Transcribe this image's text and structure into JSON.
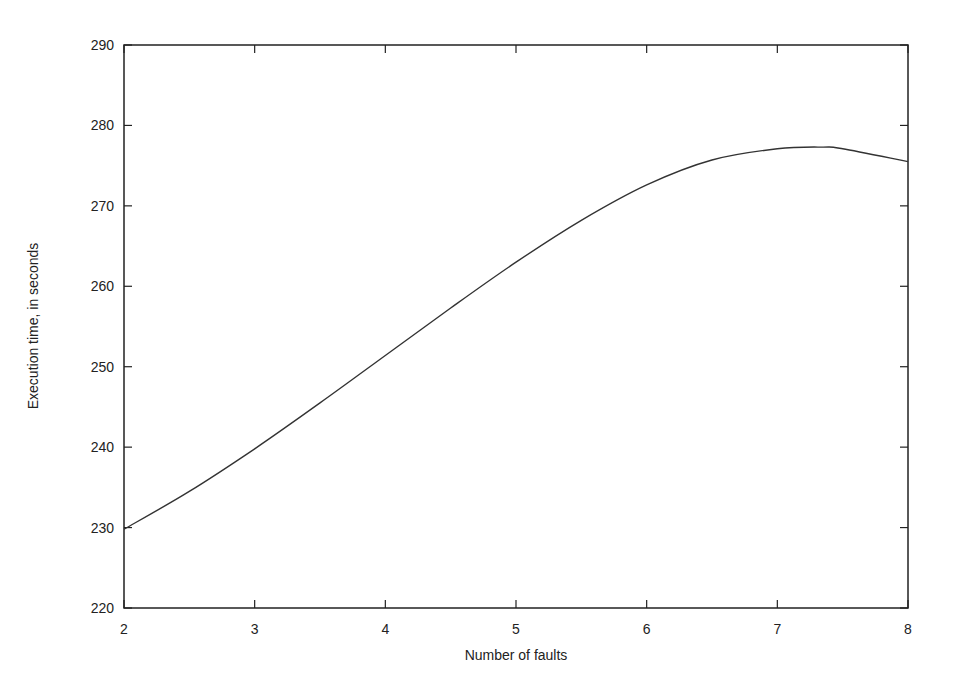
{
  "chart_data": {
    "type": "line",
    "title": "",
    "xlabel": "Number of faults",
    "ylabel": "Execution time, in seconds",
    "xlim": [
      2,
      8
    ],
    "ylim": [
      220,
      290
    ],
    "x_ticks": [
      2,
      3,
      4,
      5,
      6,
      7,
      8
    ],
    "y_ticks": [
      220,
      230,
      240,
      250,
      260,
      270,
      280,
      290
    ],
    "grid": false,
    "legend": null,
    "series": [
      {
        "name": "execution time",
        "color": "#333333",
        "x": [
          2,
          2.5,
          3,
          3.5,
          4,
          4.5,
          5,
          5.5,
          6,
          6.5,
          7,
          7.35,
          7.5,
          8
        ],
        "y": [
          229.8,
          234.5,
          239.8,
          245.5,
          251.4,
          257.3,
          263.0,
          268.2,
          272.6,
          275.7,
          277.1,
          277.3,
          277.1,
          275.5
        ]
      }
    ]
  }
}
